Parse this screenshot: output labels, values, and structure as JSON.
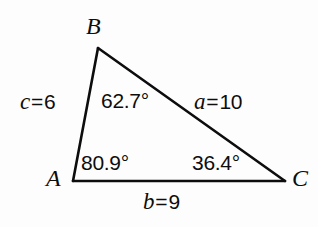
{
  "figure": {
    "kind": "triangle-diagram",
    "background_color": "#fdfdfd",
    "stroke_color": "#0d0d0d",
    "text_color": "#0d0d0d"
  },
  "vertices": [
    {
      "name": "vertex-b",
      "label": "B",
      "x": 98,
      "y": 48
    },
    {
      "name": "vertex-a",
      "label": "A",
      "x": 73,
      "y": 181
    },
    {
      "name": "vertex-c",
      "label": "C",
      "x": 285,
      "y": 181
    }
  ],
  "angles": [
    {
      "at": "B",
      "label": "62.7°",
      "value": 62.7
    },
    {
      "at": "A",
      "label": "80.9°",
      "value": 80.9
    },
    {
      "at": "C",
      "label": "36.4°",
      "value": 36.4
    }
  ],
  "sides": [
    {
      "name": "side-c",
      "variable": "c",
      "equals": "=",
      "value": "6",
      "label": "c = 6",
      "opposite_vertex": "C",
      "between": "A-B"
    },
    {
      "name": "side-a",
      "variable": "a",
      "equals": "=",
      "value": "10",
      "label": "a = 10",
      "opposite_vertex": "A",
      "between": "B-C"
    },
    {
      "name": "side-b",
      "variable": "b",
      "equals": "=",
      "value": "9",
      "label": "b = 9",
      "opposite_vertex": "B",
      "between": "A-C"
    }
  ]
}
